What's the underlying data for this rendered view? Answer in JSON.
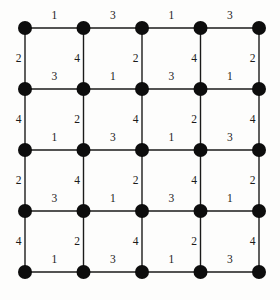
{
  "figure": {
    "background_color": "#fdfdfc",
    "node_color": "#0d0d0d",
    "edge_color": "#1a1a1a",
    "label_color": "#1a1a1a"
  },
  "chart_data": {
    "type": "diagram",
    "subtype": "weighted-grid-graph",
    "rows": 5,
    "cols": 5,
    "node_count": 25,
    "edge_count": 40,
    "node_radius": 7,
    "origin_x": 25,
    "origin_y": 28,
    "spacing_x": 58.5,
    "spacing_y": 61,
    "grid": true,
    "legend": null,
    "xlabel": "",
    "ylabel": "",
    "horizontal_weights": [
      [
        1,
        3,
        1,
        3
      ],
      [
        3,
        1,
        3,
        1
      ],
      [
        1,
        3,
        1,
        3
      ],
      [
        3,
        1,
        3,
        1
      ],
      [
        1,
        3,
        1,
        3
      ]
    ],
    "vertical_weights": [
      [
        2,
        4,
        2,
        4,
        2
      ],
      [
        4,
        2,
        4,
        2,
        4
      ],
      [
        2,
        4,
        2,
        4,
        2
      ],
      [
        4,
        2,
        4,
        2,
        4
      ]
    ],
    "weight_values": [
      1,
      2,
      3,
      4
    ],
    "annotations": []
  }
}
